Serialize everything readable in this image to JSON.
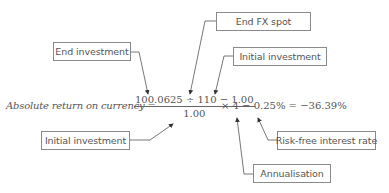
{
  "diagram": {
    "formula": {
      "lhs_label": "Absolute return on currency",
      "equals": "=",
      "numerator": "100.0625 ÷ 110 − 1.00",
      "denominator": "1.00",
      "tail": "× 4 − 0.25% = −36.39%"
    },
    "callouts": [
      {
        "id": "end-investment",
        "label": "End investment",
        "points_to": "100.0625"
      },
      {
        "id": "end-fx-spot",
        "label": "End FX spot",
        "points_to": "110"
      },
      {
        "id": "initial-investment-top",
        "label": "Initial investment",
        "points_to": "1.00 (numerator)"
      },
      {
        "id": "initial-investment-bottom",
        "label": "Initial investment",
        "points_to": "1.00 (denominator)"
      },
      {
        "id": "risk-free-interest-rate",
        "label": "Risk-free interest rate",
        "points_to": "0.25%"
      },
      {
        "id": "annualisation",
        "label": "Annualisation",
        "points_to": "4"
      }
    ],
    "colors": {
      "line": "#555555",
      "box_border": "#8a8a8a",
      "text": "#555555"
    }
  }
}
